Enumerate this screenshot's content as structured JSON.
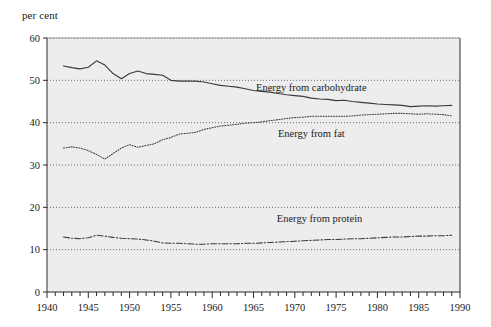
{
  "chart_data": {
    "type": "line",
    "title": "",
    "subtitle": "",
    "ylabel": "per cent",
    "xlabel": "",
    "xlim": [
      1940,
      1990
    ],
    "ylim": [
      0,
      60
    ],
    "ytick_values": [
      0,
      10,
      20,
      30,
      40,
      50,
      60
    ],
    "ytick_labels": [
      "0",
      "10",
      "20",
      "30",
      "40",
      "50",
      "60"
    ],
    "xtick_labels": [
      "1940",
      "1945",
      "1950",
      "1955",
      "1960",
      "1965",
      "1970",
      "1975",
      "1980",
      "1985",
      "1990"
    ],
    "xtick_values": [
      1940,
      1945,
      1950,
      1955,
      1960,
      1965,
      1970,
      1975,
      1980,
      1985,
      1990
    ],
    "xtick_minor_step": 1,
    "grid": "horizontal-dotted",
    "legend_position": "inline-annotations",
    "plot_background": "#ededed",
    "line_color": "#3a3a3a",
    "series": [
      {
        "name": "Energy from carbohydrate",
        "label": "Energy from carbohydrate",
        "style": "solid",
        "x": [
          1942,
          1943,
          1944,
          1945,
          1946,
          1947,
          1948,
          1949,
          1950,
          1951,
          1952,
          1953,
          1954,
          1955,
          1956,
          1957,
          1958,
          1959,
          1960,
          1961,
          1962,
          1963,
          1964,
          1965,
          1966,
          1967,
          1968,
          1969,
          1970,
          1971,
          1972,
          1973,
          1974,
          1975,
          1976,
          1977,
          1978,
          1979,
          1980,
          1981,
          1982,
          1983,
          1984,
          1985,
          1986,
          1987,
          1988,
          1989
        ],
        "values": [
          53.4,
          53.0,
          52.7,
          53.1,
          54.6,
          53.6,
          51.6,
          50.4,
          51.6,
          52.2,
          51.6,
          51.4,
          51.2,
          50.0,
          49.8,
          49.8,
          49.8,
          49.6,
          49.2,
          48.8,
          48.6,
          48.4,
          48.0,
          47.6,
          47.4,
          47.2,
          46.9,
          46.6,
          46.4,
          46.2,
          45.8,
          45.6,
          45.5,
          45.2,
          45.3,
          45.0,
          44.8,
          44.6,
          44.4,
          44.3,
          44.2,
          44.1,
          43.8,
          43.9,
          44.0,
          43.9,
          44.0,
          44.1
        ],
        "label_x": 1972,
        "label_y": 47.5
      },
      {
        "name": "Energy from fat",
        "label": "Energy from fat",
        "style": "dotted",
        "x": [
          1942,
          1943,
          1944,
          1945,
          1946,
          1947,
          1948,
          1949,
          1950,
          1951,
          1952,
          1953,
          1954,
          1955,
          1956,
          1957,
          1958,
          1959,
          1960,
          1961,
          1962,
          1963,
          1964,
          1965,
          1966,
          1967,
          1968,
          1969,
          1970,
          1971,
          1972,
          1973,
          1974,
          1975,
          1976,
          1977,
          1978,
          1979,
          1980,
          1981,
          1982,
          1983,
          1984,
          1985,
          1986,
          1987,
          1988,
          1989
        ],
        "values": [
          34.0,
          34.3,
          34.0,
          33.4,
          32.5,
          31.4,
          32.7,
          34.0,
          34.8,
          34.2,
          34.6,
          35.0,
          36.0,
          36.5,
          37.3,
          37.5,
          37.7,
          38.4,
          38.8,
          39.2,
          39.4,
          39.6,
          39.9,
          40.0,
          40.2,
          40.5,
          40.7,
          41.0,
          41.2,
          41.3,
          41.5,
          41.5,
          41.5,
          41.5,
          41.5,
          41.6,
          41.8,
          41.9,
          42.0,
          42.1,
          42.2,
          42.2,
          42.1,
          42.0,
          42.1,
          42.0,
          41.9,
          41.6
        ],
        "label_x": 1972,
        "label_y": 36.5
      },
      {
        "name": "Energy from protein",
        "label": "Energy from protein",
        "style": "dash-dot",
        "x": [
          1942,
          1943,
          1944,
          1945,
          1946,
          1947,
          1948,
          1949,
          1950,
          1951,
          1952,
          1953,
          1954,
          1955,
          1956,
          1957,
          1958,
          1959,
          1960,
          1961,
          1962,
          1963,
          1964,
          1965,
          1966,
          1967,
          1968,
          1969,
          1970,
          1971,
          1972,
          1973,
          1974,
          1975,
          1976,
          1977,
          1978,
          1979,
          1980,
          1981,
          1982,
          1983,
          1984,
          1985,
          1986,
          1987,
          1988,
          1989
        ],
        "values": [
          13.0,
          12.7,
          12.6,
          12.8,
          13.4,
          13.2,
          12.9,
          12.7,
          12.6,
          12.5,
          12.3,
          12.0,
          11.6,
          11.5,
          11.5,
          11.4,
          11.3,
          11.3,
          11.4,
          11.4,
          11.4,
          11.4,
          11.5,
          11.5,
          11.6,
          11.7,
          11.8,
          11.9,
          12.0,
          12.1,
          12.2,
          12.3,
          12.4,
          12.4,
          12.5,
          12.6,
          12.6,
          12.7,
          12.8,
          12.9,
          13.0,
          13.0,
          13.1,
          13.2,
          13.2,
          13.3,
          13.3,
          13.4
        ],
        "label_x": 1973,
        "label_y": 16.6
      }
    ]
  }
}
